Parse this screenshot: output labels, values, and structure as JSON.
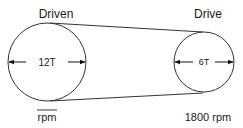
{
  "diagram": {
    "driven": {
      "title": "Driven",
      "teeth": "12T",
      "speed": "rpm"
    },
    "drive": {
      "title": "Drive",
      "teeth": "6T",
      "speed": "1800 rpm"
    },
    "colors": {
      "stroke": "#333333",
      "text": "#1a1a1a",
      "background": "#ffffff"
    }
  }
}
